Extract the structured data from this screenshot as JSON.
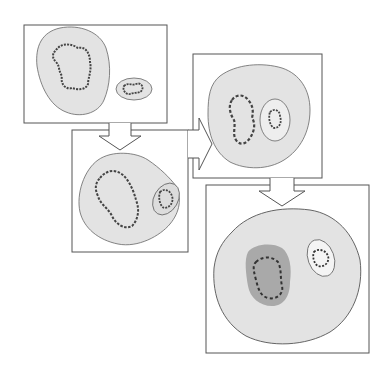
{
  "diagram": {
    "type": "cell-stage-sequence",
    "panels": [
      {
        "id": "stage-1",
        "description": "Cell with large nucleus (loose chromatin loop) and separate small micronucleus"
      },
      {
        "id": "stage-2",
        "description": "Cell with nucleus chromatin beginning to condense; micronucleus near membrane"
      },
      {
        "id": "stage-3",
        "description": "Rounded cell with condensing chromosomes; micronucleus enclosed inside"
      },
      {
        "id": "stage-4",
        "description": "Large cell with dark-shaded nucleus containing condensed chromosomes and a small inclusion"
      }
    ],
    "arrows": [
      {
        "from": "stage-1",
        "to": "stage-2",
        "direction": "down"
      },
      {
        "from": "stage-2",
        "to": "stage-3",
        "direction": "right"
      },
      {
        "from": "stage-3",
        "to": "stage-4",
        "direction": "down"
      }
    ],
    "colors": {
      "stroke": "#555555",
      "cytoplasm": "#e3e3e3",
      "membrane": "#666666",
      "nucleus_dark": "#a9a9a9",
      "chromatin": "#444444",
      "background": "#ffffff"
    }
  }
}
